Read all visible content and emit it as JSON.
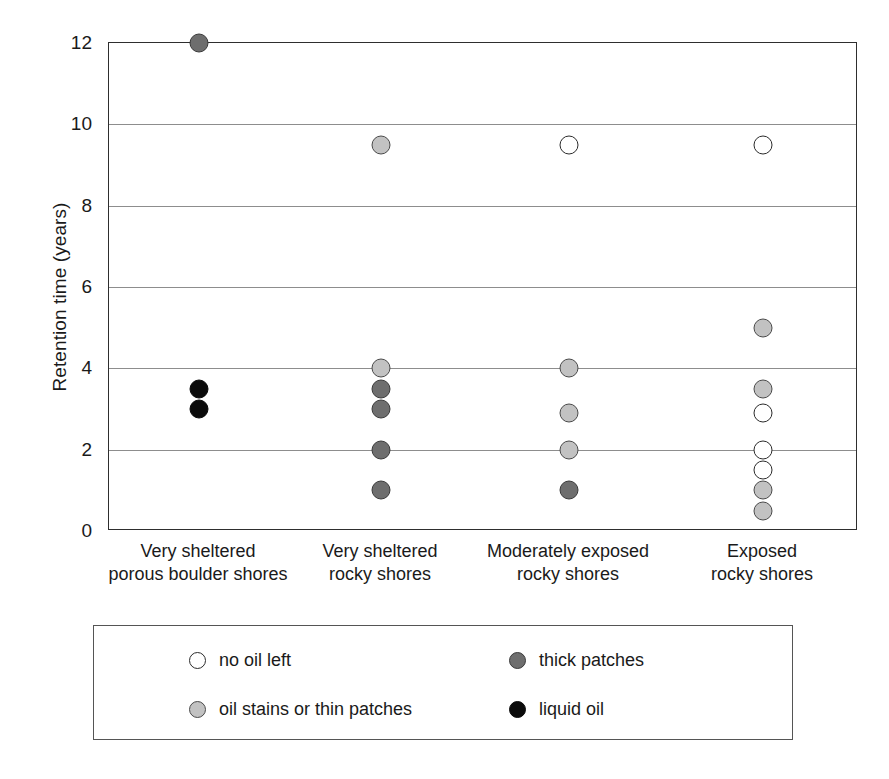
{
  "chart_data": {
    "type": "scatter",
    "title": "",
    "xlabel": "",
    "ylabel": "Retention time (years)",
    "ylim": [
      0,
      12
    ],
    "yticks": [
      0,
      2,
      4,
      6,
      8,
      10,
      12
    ],
    "grid": "horizontal",
    "legend_position": "below-plot",
    "categories": [
      "Very sheltered\nporous boulder shores",
      "Very sheltered\nrocky shores",
      "Moderately exposed\nrocky shores",
      "Exposed\nrocky shores"
    ],
    "series": [
      {
        "name": "no oil left",
        "key": "nooil",
        "color": "#ffffff"
      },
      {
        "name": "oil stains or thin patches",
        "key": "stains",
        "color": "#c2c2c2"
      },
      {
        "name": "thick patches",
        "key": "thick",
        "color": "#6e6e6e"
      },
      {
        "name": "liquid oil",
        "key": "liquid",
        "color": "#0b0b0b"
      }
    ],
    "points": [
      {
        "category": 0,
        "value": 12.0,
        "series": "thick"
      },
      {
        "category": 0,
        "value": 3.5,
        "series": "liquid"
      },
      {
        "category": 0,
        "value": 3.0,
        "series": "liquid"
      },
      {
        "category": 1,
        "value": 9.5,
        "series": "stains"
      },
      {
        "category": 1,
        "value": 4.0,
        "series": "stains"
      },
      {
        "category": 1,
        "value": 3.5,
        "series": "thick"
      },
      {
        "category": 1,
        "value": 3.0,
        "series": "thick"
      },
      {
        "category": 1,
        "value": 2.0,
        "series": "thick"
      },
      {
        "category": 1,
        "value": 1.0,
        "series": "thick"
      },
      {
        "category": 2,
        "value": 9.5,
        "series": "nooil"
      },
      {
        "category": 2,
        "value": 4.0,
        "series": "stains"
      },
      {
        "category": 2,
        "value": 2.9,
        "series": "stains"
      },
      {
        "category": 2,
        "value": 2.0,
        "series": "stains"
      },
      {
        "category": 2,
        "value": 1.0,
        "series": "thick"
      },
      {
        "category": 3,
        "value": 9.5,
        "series": "nooil"
      },
      {
        "category": 3,
        "value": 5.0,
        "series": "stains"
      },
      {
        "category": 3,
        "value": 3.5,
        "series": "stains"
      },
      {
        "category": 3,
        "value": 2.9,
        "series": "nooil"
      },
      {
        "category": 3,
        "value": 2.0,
        "series": "nooil"
      },
      {
        "category": 3,
        "value": 1.5,
        "series": "nooil"
      },
      {
        "category": 3,
        "value": 1.0,
        "series": "stains"
      },
      {
        "category": 3,
        "value": 0.5,
        "series": "stains"
      }
    ]
  },
  "axis": {
    "y_title": "Retention time (years)",
    "y_tick_labels": [
      "12",
      "10",
      "8",
      "6",
      "4",
      "2",
      "0"
    ]
  },
  "legend": {
    "entries": [
      {
        "label": "no oil left",
        "series": "nooil"
      },
      {
        "label": "thick patches",
        "series": "thick"
      },
      {
        "label": "oil stains or thin patches",
        "series": "stains"
      },
      {
        "label": "liquid oil",
        "series": "liquid"
      }
    ]
  },
  "x_categories": [
    {
      "line1": "Very sheltered",
      "line2": "porous boulder shores"
    },
    {
      "line1": "Very sheltered",
      "line2": "rocky shores"
    },
    {
      "line1": "Moderately exposed",
      "line2": "rocky shores"
    },
    {
      "line1": "Exposed",
      "line2": "rocky shores"
    }
  ]
}
